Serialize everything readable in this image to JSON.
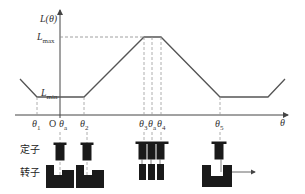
{
  "diagram": {
    "y_axis_label": "L(θ)",
    "x_axis_label": "θ",
    "origin_label": "O",
    "levels": {
      "max": {
        "base": "L",
        "sub": "max"
      },
      "min": {
        "base": "L",
        "sub": "min"
      }
    },
    "x_ticks": [
      {
        "base": "θ",
        "sub": "1"
      },
      {
        "base": "θ",
        "sub": "a"
      },
      {
        "base": "θ",
        "sub": "2"
      },
      {
        "base": "θ",
        "sub": "3"
      },
      {
        "base": "θ",
        "sub": "a"
      },
      {
        "base": "θ",
        "sub": "4"
      },
      {
        "base": "θ",
        "sub": "5"
      }
    ],
    "row_labels": {
      "stator": "定子",
      "rotor": "转子"
    },
    "colors": {
      "line": "#555555",
      "dashed": "#888888",
      "block": "#1a1a1a"
    }
  }
}
